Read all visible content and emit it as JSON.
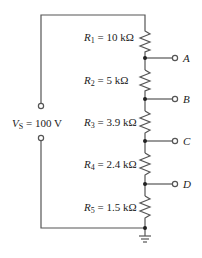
{
  "source": {
    "symbol": "V",
    "subscript": "S",
    "value": " = 100 V"
  },
  "resistors": [
    {
      "symbol": "R",
      "subscript": "1",
      "value": " = 10 kΩ"
    },
    {
      "symbol": "R",
      "subscript": "2",
      "value": " = 5 kΩ"
    },
    {
      "symbol": "R",
      "subscript": "3",
      "value": " = 3.9 kΩ"
    },
    {
      "symbol": "R",
      "subscript": "4",
      "value": " = 2.4 kΩ"
    },
    {
      "symbol": "R",
      "subscript": "5",
      "value": " = 1.5 kΩ"
    }
  ],
  "terminals": [
    "A",
    "B",
    "C",
    "D"
  ],
  "colors": {
    "wire": "#555555",
    "text": "#222222"
  }
}
